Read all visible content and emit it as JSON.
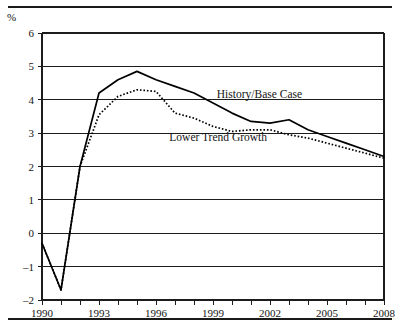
{
  "chart_data": {
    "type": "line",
    "title": "",
    "xlabel": "",
    "ylabel": "%",
    "ylim": [
      -2,
      6
    ],
    "xlim": [
      1990,
      2008
    ],
    "grid": true,
    "legend_position": "inline-annotation",
    "ytick_labels": [
      "6",
      "5",
      "4",
      "3",
      "2",
      "1",
      "0",
      "-1",
      "-2"
    ],
    "ytick_values": [
      6,
      5,
      4,
      3,
      2,
      1,
      0,
      -1,
      -2
    ],
    "xtick_values": [
      1990,
      1991,
      1992,
      1993,
      1994,
      1995,
      1996,
      1997,
      1998,
      1999,
      2000,
      2001,
      2002,
      2003,
      2004,
      2005,
      2006,
      2007,
      2008
    ],
    "xtick_labels_shown": [
      "1990",
      "1993",
      "1996",
      "1999",
      "2002",
      "2005",
      "2008"
    ],
    "xtick_labeled_values": [
      1990,
      1993,
      1996,
      1999,
      2002,
      2005,
      2008
    ],
    "x": [
      1990,
      1991,
      1992,
      1993,
      1994,
      1995,
      1996,
      1997,
      1998,
      1999,
      2000,
      2001,
      2002,
      2003,
      2004,
      2005,
      2006,
      2007,
      2008
    ],
    "series": [
      {
        "name": "History/Base Case",
        "style": "solid",
        "color": "#000000",
        "values": [
          -0.3,
          -1.7,
          2.0,
          4.2,
          4.6,
          4.85,
          4.6,
          4.4,
          4.2,
          3.9,
          3.6,
          3.35,
          3.3,
          3.4,
          3.1,
          2.9,
          2.7,
          2.5,
          2.3
        ],
        "label_text": "History/Base Case"
      },
      {
        "name": "Lower Trend Growth",
        "style": "dotted",
        "color": "#000000",
        "values": [
          -0.3,
          -1.7,
          2.0,
          3.55,
          4.1,
          4.3,
          4.25,
          3.6,
          3.45,
          3.2,
          3.05,
          3.1,
          3.1,
          2.95,
          2.85,
          2.7,
          2.55,
          2.4,
          2.25
        ],
        "label_text": "Lower Trend Growth"
      }
    ],
    "annotations": [
      {
        "text": "History/Base Case",
        "x": 1999.2,
        "y": 4.05
      },
      {
        "text": "Lower Trend Growth",
        "x": 1996.7,
        "y": 2.75
      }
    ]
  }
}
